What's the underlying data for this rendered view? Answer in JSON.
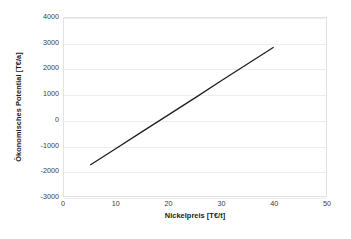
{
  "chart_data": {
    "type": "line",
    "title": "",
    "xlabel": "Nickelpreis [T€/t]",
    "ylabel": "Ökonomisches Potential  [T€/a]",
    "xlim": [
      0,
      50
    ],
    "ylim": [
      -3000,
      4000
    ],
    "xticks": [
      0,
      10,
      20,
      30,
      40,
      50
    ],
    "yticks": [
      -3000,
      -2000,
      -1000,
      0,
      1000,
      2000,
      3000,
      4000
    ],
    "xtick_labels": [
      "0",
      "10",
      "20",
      "30",
      "40",
      "50"
    ],
    "ytick_labels": [
      "-3000",
      "-2000",
      "-1000",
      "0",
      "1000",
      "2000",
      "3000",
      "4000"
    ],
    "grid": "horizontal",
    "legend": "none",
    "series": [
      {
        "name": "Ökonomisches Potential",
        "color": "#1f1f1f",
        "line_width": 1.3,
        "x": [
          5,
          10,
          15,
          20,
          25,
          30,
          35,
          40
        ],
        "values": [
          -1780,
          -1120,
          -460,
          200,
          860,
          1530,
          2190,
          2850
        ]
      }
    ],
    "annotations": []
  },
  "axes": {
    "y_title": "Ökonomisches Potential  [T€/a]",
    "x_title": "Nickelpreis [T€/t]"
  },
  "colors": {
    "line": "#1f1f1f",
    "gridline": "#ededed",
    "plot_border": "#e2e2e2",
    "background": "#ffffff",
    "tick_text": "#3a3a3a",
    "title_text": "#1a1a1a"
  }
}
